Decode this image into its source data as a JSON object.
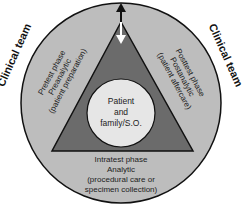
{
  "diagram": {
    "outer_label_left": "Clinical team",
    "outer_label_right": "Clinical team",
    "center": {
      "lines": [
        "Patient",
        "and",
        "family/S.O."
      ]
    },
    "phases": {
      "pretest": {
        "lines": [
          "Pretest phase",
          "Preanalytic",
          "(patient preparation)"
        ]
      },
      "posttest": {
        "lines": [
          "Posttest phase",
          "Postanalytic",
          "(patient aftercare)"
        ]
      },
      "intratest": {
        "lines": [
          "Intratest phase",
          "Analytic",
          "(procedural care or",
          "specimen collection)"
        ]
      }
    },
    "arrows": {
      "up": "arrow-up",
      "down": "arrow-down"
    },
    "colors": {
      "ring": "#bdbdbd",
      "triangle": "#6b6b6b",
      "inner_circle": "#e6e6e6",
      "outline": "#111111"
    }
  }
}
